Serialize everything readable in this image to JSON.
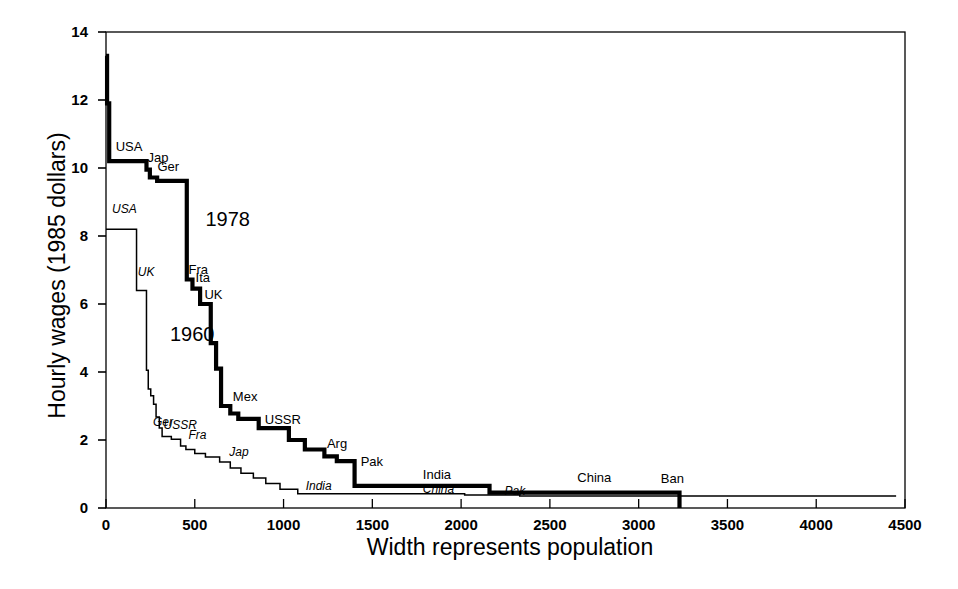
{
  "chart_data": {
    "type": "line",
    "title": "",
    "xlabel": "Width represents population",
    "ylabel": "Hourly wages (1985 dollars)",
    "xlim": [
      0,
      4500
    ],
    "ylim": [
      0,
      14
    ],
    "xticks": [
      0,
      500,
      1000,
      1500,
      2000,
      2500,
      3000,
      3500,
      4000,
      4500
    ],
    "xtick_labels": [
      "0",
      "500",
      "1000",
      "1500",
      "2000",
      "2500",
      "3000",
      "3500",
      "4000",
      "4500"
    ],
    "yticks": [
      0,
      2,
      4,
      6,
      8,
      10,
      12,
      14
    ],
    "ytick_labels": [
      "0",
      "2",
      "4",
      "6",
      "8",
      "10",
      "12",
      "14"
    ],
    "grid": false,
    "legend_position": "inline-annotations",
    "note": "Step chart: horizontal run width = population (millions), height = hourly wage",
    "series": [
      {
        "name": "1978",
        "style": "thick-solid",
        "label_text": "1978",
        "steps": [
          [
            0,
            13.3
          ],
          [
            6,
            13.3
          ],
          [
            6,
            11.9
          ],
          [
            18,
            11.9
          ],
          [
            18,
            10.2
          ],
          [
            228,
            10.2
          ],
          [
            228,
            9.95
          ],
          [
            247,
            9.95
          ],
          [
            247,
            9.72
          ],
          [
            288,
            9.72
          ],
          [
            288,
            9.62
          ],
          [
            455,
            9.62
          ],
          [
            455,
            6.72
          ],
          [
            487,
            6.72
          ],
          [
            487,
            6.45
          ],
          [
            530,
            6.45
          ],
          [
            530,
            6.0
          ],
          [
            590,
            6.0
          ],
          [
            590,
            4.85
          ],
          [
            620,
            4.85
          ],
          [
            620,
            4.1
          ],
          [
            648,
            4.1
          ],
          [
            648,
            3.0
          ],
          [
            700,
            3.0
          ],
          [
            700,
            2.78
          ],
          [
            745,
            2.78
          ],
          [
            745,
            2.62
          ],
          [
            860,
            2.62
          ],
          [
            860,
            2.35
          ],
          [
            1030,
            2.35
          ],
          [
            1030,
            2.0
          ],
          [
            1120,
            2.0
          ],
          [
            1120,
            1.72
          ],
          [
            1230,
            1.72
          ],
          [
            1230,
            1.52
          ],
          [
            1300,
            1.52
          ],
          [
            1300,
            1.38
          ],
          [
            1400,
            1.38
          ],
          [
            1400,
            0.65
          ],
          [
            2160,
            0.65
          ],
          [
            2160,
            0.45
          ],
          [
            3230,
            0.45
          ],
          [
            3230,
            0.0
          ]
        ],
        "point_labels": [
          {
            "text": "USA",
            "x": 60,
            "y": 10.55
          },
          {
            "text": "Jap",
            "x": 240,
            "y": 10.25
          },
          {
            "text": "Ger",
            "x": 295,
            "y": 9.98
          },
          {
            "text": "Fra",
            "x": 470,
            "y": 6.95
          },
          {
            "text": "Ita",
            "x": 510,
            "y": 6.72
          },
          {
            "text": "UK",
            "x": 560,
            "y": 6.2
          },
          {
            "text": "Mex",
            "x": 720,
            "y": 3.2
          },
          {
            "text": "USSR",
            "x": 900,
            "y": 2.52
          },
          {
            "text": "Arg",
            "x": 1250,
            "y": 1.82
          },
          {
            "text": "Pak",
            "x": 1440,
            "y": 1.28
          },
          {
            "text": "India",
            "x": 1790,
            "y": 0.92
          },
          {
            "text": "China",
            "x": 2660,
            "y": 0.82
          },
          {
            "text": "Ban",
            "x": 3130,
            "y": 0.78
          }
        ]
      },
      {
        "name": "1960",
        "style": "thin-solid",
        "label_text": "1960",
        "steps": [
          [
            0,
            8.2
          ],
          [
            172,
            8.2
          ],
          [
            172,
            6.4
          ],
          [
            228,
            6.4
          ],
          [
            228,
            4.05
          ],
          [
            238,
            4.05
          ],
          [
            238,
            3.5
          ],
          [
            252,
            3.5
          ],
          [
            252,
            3.3
          ],
          [
            268,
            3.3
          ],
          [
            268,
            3.05
          ],
          [
            282,
            3.05
          ],
          [
            282,
            2.68
          ],
          [
            300,
            2.68
          ],
          [
            300,
            2.35
          ],
          [
            316,
            2.35
          ],
          [
            316,
            2.1
          ],
          [
            368,
            2.1
          ],
          [
            368,
            2.02
          ],
          [
            420,
            2.02
          ],
          [
            420,
            1.82
          ],
          [
            450,
            1.82
          ],
          [
            450,
            1.72
          ],
          [
            500,
            1.72
          ],
          [
            500,
            1.6
          ],
          [
            560,
            1.6
          ],
          [
            560,
            1.5
          ],
          [
            640,
            1.5
          ],
          [
            640,
            1.35
          ],
          [
            700,
            1.35
          ],
          [
            700,
            1.18
          ],
          [
            760,
            1.18
          ],
          [
            760,
            1.02
          ],
          [
            830,
            1.02
          ],
          [
            830,
            0.88
          ],
          [
            900,
            0.88
          ],
          [
            900,
            0.72
          ],
          [
            980,
            0.72
          ],
          [
            980,
            0.55
          ],
          [
            1080,
            0.55
          ],
          [
            1080,
            0.42
          ],
          [
            2020,
            0.42
          ],
          [
            2020,
            0.38
          ],
          [
            2330,
            0.38
          ],
          [
            2330,
            0.35
          ],
          [
            4450,
            0.35
          ]
        ],
        "point_labels": [
          {
            "text": "USA",
            "x": 40,
            "y": 8.7
          },
          {
            "text": "UK",
            "x": 185,
            "y": 6.85
          },
          {
            "text": "Ger",
            "x": 270,
            "y": 2.45
          },
          {
            "text": "USSR",
            "x": 330,
            "y": 2.35
          },
          {
            "text": "Fra",
            "x": 470,
            "y": 2.05
          },
          {
            "text": "Jap",
            "x": 700,
            "y": 1.55
          },
          {
            "text": "India",
            "x": 1130,
            "y": 0.55
          },
          {
            "text": "China",
            "x": 1790,
            "y": 0.48
          },
          {
            "text": "Pak",
            "x": 2250,
            "y": 0.42
          }
        ]
      }
    ],
    "series_tags": [
      {
        "text": "1978",
        "x": 560,
        "y": 8.45
      },
      {
        "text": "1960",
        "x": 360,
        "y": 5.05
      }
    ]
  },
  "colors": {
    "line": "#000000",
    "axis": "#000000",
    "background": "#ffffff"
  }
}
